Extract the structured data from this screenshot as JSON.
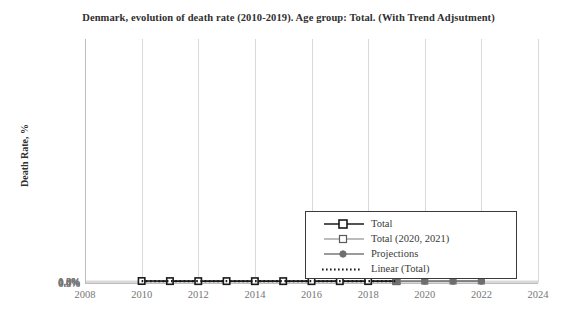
{
  "chart_data": {
    "type": "line",
    "title": "Denmark, evolution of death rate (2010-2019). Age group: Total. (With Trend Adjsutment)",
    "xlabel": "",
    "ylabel": "Death Rate, %",
    "xlim": [
      2008,
      2024
    ],
    "ylim": [
      0.0,
      1.2
    ],
    "xticks": [
      "2008",
      "2010",
      "2012",
      "2014",
      "2016",
      "2018",
      "2020",
      "2022",
      "2024"
    ],
    "yticks": [
      "0.0%",
      "0.2%",
      "0.4%",
      "0.6%",
      "0.8%",
      "1.0%",
      "1.2%"
    ],
    "grid": true,
    "legend_position": "lower-right",
    "series": [
      {
        "name": "Total",
        "marker": "square-open",
        "color": "#1a1a1a",
        "x": [
          2010,
          2011,
          2012,
          2013,
          2014,
          2015,
          2016,
          2017,
          2018,
          2019
        ],
        "values": [
          0.98,
          0.935,
          0.925,
          0.93,
          0.905,
          0.92,
          0.915,
          0.915,
          0.95,
          0.92
        ]
      },
      {
        "name": "Total (2020, 2021)",
        "marker": "square-open",
        "color": "#7a7a7a",
        "x": [
          2019,
          2020,
          2021,
          2022
        ],
        "values": [
          0.92,
          0.925,
          0.975,
          1.02
        ]
      },
      {
        "name": "Projections",
        "marker": "circle-filled",
        "color": "#7a7a7a",
        "x": [
          2019,
          2020,
          2021,
          2022
        ],
        "values": [
          0.92,
          0.915,
          0.91,
          0.91
        ]
      },
      {
        "name": "Linear (Total)",
        "marker": "none",
        "style": "dotted",
        "color": "#1a1a1a",
        "x": [
          2010,
          2019
        ],
        "values": [
          0.945,
          0.925
        ]
      }
    ]
  },
  "legend": {
    "items": [
      {
        "label": "Total"
      },
      {
        "label": "Total (2020, 2021)"
      },
      {
        "label": "Projections"
      },
      {
        "label": "Linear (Total)"
      }
    ]
  }
}
